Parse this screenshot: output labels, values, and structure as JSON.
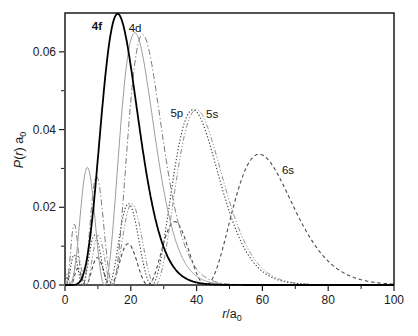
{
  "figure": {
    "background": "#ffffff",
    "frame_color": "#1a1a1a",
    "text_color": "#1a1a1a"
  },
  "chart_data": {
    "type": "line",
    "title": "",
    "model_note": "hydrogen-like radial distribution functions P(r) = r^2 R_nl(r)^2 plotted in units of the Bohr radius a0",
    "x_axis": {
      "label_parts": [
        {
          "t": "r",
          "italic": true
        },
        {
          "t": "/a"
        },
        {
          "t": "0",
          "sub": true
        }
      ],
      "min": 0,
      "max": 100,
      "major_ticks": [
        0,
        20,
        40,
        60,
        80,
        100
      ],
      "tick_labels": [
        "0",
        "20",
        "40",
        "60",
        "80",
        "100"
      ],
      "minor_ticks": [
        10,
        30,
        50,
        70,
        90
      ]
    },
    "y_axis": {
      "label_parts": [
        {
          "t": "P",
          "italic": true
        },
        {
          "t": "("
        },
        {
          "t": "r",
          "italic": true
        },
        {
          "t": ") a"
        },
        {
          "t": "0",
          "sub": true
        }
      ],
      "min": 0,
      "max": 0.07,
      "major_ticks": [
        0,
        0.02,
        0.04,
        0.06
      ],
      "tick_labels": [
        "0.00",
        "0.02",
        "0.04",
        "0.06"
      ],
      "minor_ticks": [
        0.01,
        0.03,
        0.05
      ]
    },
    "grid": false,
    "legend": "labels placed beside curve peaks",
    "series": [
      {
        "label": "4f",
        "label_bold": true,
        "n": 4,
        "l": 3,
        "line": "solid",
        "color": "#000000",
        "width": 1.8,
        "label_at": {
          "x": 9.7,
          "y": 0.0666
        },
        "maxima": [
          [
            16.0,
            0.0698
          ]
        ]
      },
      {
        "label": "4d",
        "label_bold": false,
        "n": 4,
        "l": 2,
        "line": "solid",
        "color": "#9c9c9c",
        "width": 1.0,
        "label_at": {
          "x": 21.3,
          "y": 0.0661
        },
        "maxima": [
          [
            6.1,
            0.0315
          ],
          [
            20.9,
            0.0649
          ]
        ]
      },
      {
        "label": "",
        "label_bold": false,
        "n": 4,
        "l": 1,
        "line": "dash-dot",
        "color": "#7a7a7a",
        "width": 1.0,
        "label_at": null,
        "maxima": [
          [
            2.4,
            0.0145
          ],
          [
            9.4,
            0.0277
          ],
          [
            23.7,
            0.0648
          ]
        ]
      },
      {
        "label": "5p",
        "label_bold": false,
        "n": 5,
        "l": 1,
        "line": "dotted",
        "color": "#3c3c3c",
        "width": 1.1,
        "label_at": {
          "x": 34.0,
          "y": 0.0443
        },
        "maxima": [
          [
            2.1,
            0.0059
          ],
          [
            8.1,
            0.0107
          ],
          [
            18.4,
            0.0189
          ],
          [
            39.1,
            0.0449
          ]
        ]
      },
      {
        "label": "5s",
        "label_bold": false,
        "n": 5,
        "l": 0,
        "line": "dash-dot-dot",
        "color": "#8c8c8c",
        "width": 1.0,
        "label_at": {
          "x": 44.7,
          "y": 0.044
        },
        "maxima": [
          [
            0.75,
            0.0031
          ],
          [
            3.3,
            0.0061
          ],
          [
            9.0,
            0.0093
          ],
          [
            19.8,
            0.0208
          ],
          [
            40.3,
            0.045
          ]
        ]
      },
      {
        "label": "6s",
        "label_bold": false,
        "n": 6,
        "l": 0,
        "line": "short-dash",
        "color": "#4a4a4a",
        "width": 1.1,
        "label_at": {
          "x": 67.8,
          "y": 0.0296
        },
        "maxima": [
          [
            0.7,
            0.0018
          ],
          [
            3.9,
            0.0042
          ],
          [
            9.5,
            0.0069
          ],
          [
            18.5,
            0.0102
          ],
          [
            31.5,
            0.0154
          ],
          [
            59.0,
            0.0336
          ]
        ]
      }
    ]
  }
}
